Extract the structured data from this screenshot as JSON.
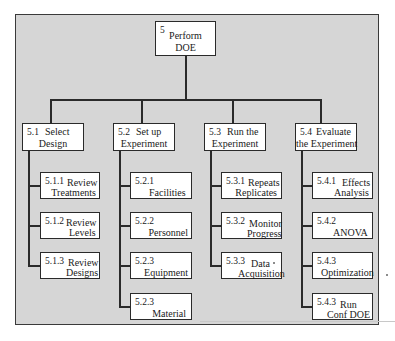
{
  "root": {
    "num": "5",
    "label_line1": "Perform",
    "label_line2": "DOE"
  },
  "branches": [
    {
      "num": "5.1",
      "label_line1": "Select",
      "label_line2": "Design",
      "children": [
        {
          "num": "5.1.1",
          "label_line1": "Review",
          "label_line2": "Treatments"
        },
        {
          "num": "5.1.2",
          "label_line1": "Review",
          "label_line2": "Levels"
        },
        {
          "num": "5.1.3",
          "label_line1": "Review",
          "label_line2": "Designs"
        }
      ]
    },
    {
      "num": "5.2",
      "label_line1": "Set up",
      "label_line2": "Experiment",
      "children": [
        {
          "num": "5.2.1",
          "label_line1": "",
          "label_line2": "Facilities"
        },
        {
          "num": "5.2.2",
          "label_line1": "",
          "label_line2": "Personnel"
        },
        {
          "num": "5.2.3",
          "label_line1": "",
          "label_line2": "Equipment"
        },
        {
          "num": "5.2.3",
          "label_line1": "",
          "label_line2": "Material"
        }
      ]
    },
    {
      "num": "5.3",
      "label_line1": "Run the",
      "label_line2": "Experiment",
      "children": [
        {
          "num": "5.3.1",
          "label_line1": "Repeats",
          "label_line2": "Replicates"
        },
        {
          "num": "5.3.2",
          "label_line1": "Monitor",
          "label_line2": "Progress"
        },
        {
          "num": "5.3.3",
          "label_line1": "Data",
          "label_line2": "Acquisition"
        }
      ]
    },
    {
      "num": "5.4",
      "label_line1": "Evaluate",
      "label_line2": "the Experiment",
      "children": [
        {
          "num": "5.4.1",
          "label_line1": "Effects",
          "label_line2": "Analysis"
        },
        {
          "num": "5.4.2",
          "label_line1": "",
          "label_line2": "ANOVA"
        },
        {
          "num": "5.4.3",
          "label_line1": "",
          "label_line2": "Optimization"
        },
        {
          "num": "5.4.3",
          "label_line1": "Run",
          "label_line2": "Conf DOE"
        }
      ]
    }
  ],
  "colors": {
    "background": "#d6d6d6",
    "box_fill": "#ffffff",
    "line": "#2a2a2a"
  }
}
